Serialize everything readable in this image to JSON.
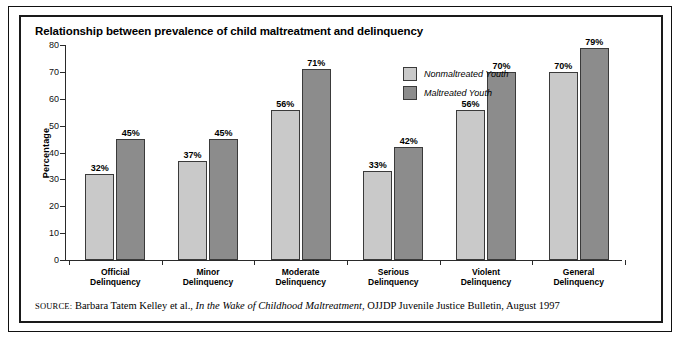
{
  "title": "Relationship between prevalence of child maltreatment and delinquency",
  "legend": {
    "items": [
      {
        "label": "Nonmaltreated Youth",
        "color": "#c9c9c9"
      },
      {
        "label": "Maltreated Youth",
        "color": "#8c8c8c"
      }
    ]
  },
  "source": {
    "tag": "Source:",
    "author": "Barbara Tatem Kelley et al.,",
    "title": "In the Wake of Childhood Maltreatment",
    "publication": ", OJJDP Juvenile Justice Bulletin, August 1997"
  },
  "chart_data": {
    "type": "bar",
    "title": "Relationship between prevalence of child maltreatment and delinquency",
    "xlabel": "",
    "ylabel": "Percentage",
    "ylim": [
      0,
      80
    ],
    "yticks": [
      0,
      10,
      20,
      30,
      40,
      50,
      60,
      70,
      80
    ],
    "grid": false,
    "legend_position": "inside-top-center",
    "categories": [
      "Official Delinquency",
      "Minor Delinquency",
      "Moderate Delinquency",
      "Serious Delinquency",
      "Violent Delinquency",
      "General Delinquency"
    ],
    "category_lines": [
      [
        "Official",
        "Delinquency"
      ],
      [
        "Minor",
        "Delinquency"
      ],
      [
        "Moderate",
        "Delinquency"
      ],
      [
        "Serious",
        "Delinquency"
      ],
      [
        "Violent",
        "Delinquency"
      ],
      [
        "General",
        "Delinquency"
      ]
    ],
    "series": [
      {
        "name": "Nonmaltreated Youth",
        "color": "#c9c9c9",
        "values": [
          32,
          37,
          56,
          33,
          56,
          70
        ],
        "labels": [
          "32%",
          "37%",
          "56%",
          "33%",
          "56%",
          "70%"
        ]
      },
      {
        "name": "Maltreated Youth",
        "color": "#8c8c8c",
        "values": [
          45,
          45,
          71,
          42,
          70,
          79
        ],
        "labels": [
          "45%",
          "45%",
          "71%",
          "42%",
          "70%",
          "79%"
        ]
      }
    ]
  }
}
